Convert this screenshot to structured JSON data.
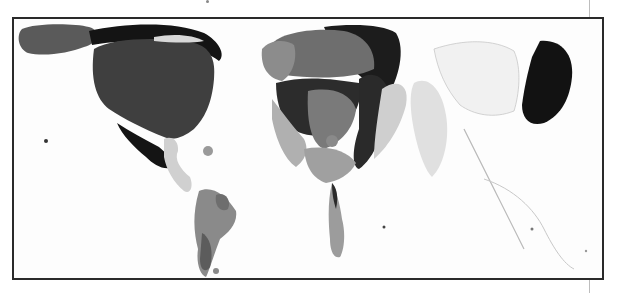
{
  "figure": {
    "type": "cartogram world map",
    "style": "grayscale",
    "frame": {
      "border_color": "#2a2a2a",
      "background": "#fdfdfd"
    },
    "shade_palette": {
      "darkest": "#141414",
      "dark": "#3a3a3a",
      "medium_dark": "#5c5c5c",
      "medium": "#7d7d7d",
      "medium_light": "#9c9c9c",
      "light": "#c4c4c4",
      "very_light": "#e2e2e2"
    },
    "regions": [
      {
        "name": "North America (USA/Canada)",
        "shade": "dark"
      },
      {
        "name": "Alaska",
        "shade": "dark"
      },
      {
        "name": "Mexico",
        "shade": "darkest"
      },
      {
        "name": "Central America & Caribbean",
        "shade": "light"
      },
      {
        "name": "South America",
        "shade": "medium"
      },
      {
        "name": "Europe",
        "shade": "medium_dark"
      },
      {
        "name": "Russia / Northern Eurasia",
        "shade": "darkest"
      },
      {
        "name": "Middle East",
        "shade": "light"
      },
      {
        "name": "Africa",
        "shade": "medium"
      },
      {
        "name": "South Africa",
        "shade": "medium_light"
      },
      {
        "name": "India",
        "shade": "very_light"
      },
      {
        "name": "East Asia (China)",
        "shade": "very_light"
      },
      {
        "name": "Japan",
        "shade": "darkest"
      },
      {
        "name": "Southeast Asia & Oceania",
        "shade": "very_light"
      }
    ]
  }
}
